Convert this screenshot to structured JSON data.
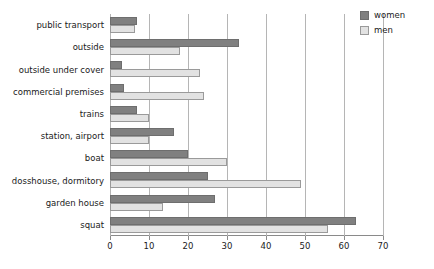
{
  "chart_data": {
    "type": "bar",
    "orientation": "horizontal",
    "title": "",
    "xlabel": "",
    "ylabel": "",
    "xlim": [
      0,
      70
    ],
    "xticks": [
      0,
      10,
      20,
      30,
      40,
      50,
      60,
      70
    ],
    "grid": true,
    "legend_position": "top-right",
    "categories": [
      "public transport",
      "outside",
      "outside under cover",
      "commercial premises",
      "trains",
      "station, airport",
      "boat",
      "dosshouse, dormitory",
      "garden house",
      "squat"
    ],
    "series": [
      {
        "name": "women",
        "color": "#808080",
        "values": [
          7,
          33,
          3,
          3.5,
          7,
          16.5,
          20,
          25,
          27,
          63
        ]
      },
      {
        "name": "men",
        "color": "#e2e2e2",
        "values": [
          6.5,
          18,
          23,
          24,
          10,
          10,
          30,
          49,
          13.5,
          56
        ]
      }
    ]
  },
  "legend": {
    "items": [
      {
        "label": "women"
      },
      {
        "label": "men"
      }
    ]
  }
}
